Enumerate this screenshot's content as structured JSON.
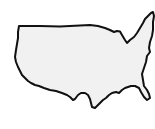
{
  "image": {
    "subject": "United States outline map",
    "alt": "Outline of the contiguous United States",
    "colors": {
      "background": "#ffffff",
      "fill": "#f1f1f1",
      "stroke": "#111111"
    },
    "stroke_width": 2
  }
}
